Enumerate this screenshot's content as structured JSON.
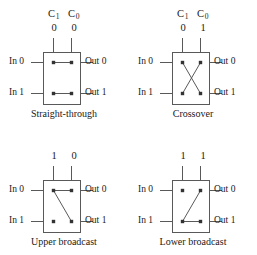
{
  "figure": {
    "background_color": "#ffffff",
    "line_color": "#595959",
    "text_color": "#1a1a1a",
    "control_header": {
      "c1": "C",
      "c1_sub": "1",
      "c0": "C",
      "c0_sub": "0"
    },
    "port_labels": {
      "in0": "In 0",
      "in1": "In 1",
      "out0": "Out 0",
      "out1": "Out 1"
    }
  },
  "cells": [
    {
      "id": "straight-through",
      "caption": "Straight-through",
      "show_control_header": true,
      "control_values": {
        "c1": "0",
        "c0": "0"
      },
      "connections": [
        {
          "from": "in0",
          "to": "out0"
        },
        {
          "from": "in1",
          "to": "out1"
        }
      ]
    },
    {
      "id": "crossover",
      "caption": "Crossover",
      "show_control_header": true,
      "control_values": {
        "c1": "0",
        "c0": "1"
      },
      "connections": [
        {
          "from": "in0",
          "to": "out1"
        },
        {
          "from": "in1",
          "to": "out0"
        }
      ]
    },
    {
      "id": "upper-broadcast",
      "caption": "Upper broadcast",
      "show_control_header": false,
      "control_values": {
        "c1": "1",
        "c0": "0"
      },
      "connections": [
        {
          "from": "in0",
          "to": "out0"
        },
        {
          "from": "in0",
          "to": "out1"
        }
      ]
    },
    {
      "id": "lower-broadcast",
      "caption": "Lower broadcast",
      "show_control_header": false,
      "control_values": {
        "c1": "1",
        "c0": "1"
      },
      "connections": [
        {
          "from": "in1",
          "to": "out1"
        },
        {
          "from": "in1",
          "to": "out0"
        }
      ]
    }
  ]
}
